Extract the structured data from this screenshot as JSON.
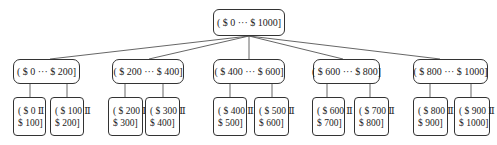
{
  "tree": {
    "root": {
      "label": "( $ 0 ··· $ 1000]"
    },
    "children": [
      {
        "label": "( $ 0 ··· $ 200]",
        "children": [
          {
            "line1": "( $ 0 Ⅱ",
            "line2": "$ 100]"
          },
          {
            "line1": "( $ 100 Ⅱ",
            "line2": "$ 200]"
          }
        ]
      },
      {
        "label": "( $ 200 ··· $ 400]",
        "children": [
          {
            "line1": "( $ 200 Ⅱ",
            "line2": "$ 300]"
          },
          {
            "line1": "( $ 300 Ⅱ",
            "line2": "$ 400]"
          }
        ]
      },
      {
        "label": "( $ 400 ··· $ 600]",
        "children": [
          {
            "line1": "( $ 400 Ⅱ",
            "line2": "$ 500]"
          },
          {
            "line1": "( $ 500 Ⅱ",
            "line2": "$ 600]"
          }
        ]
      },
      {
        "label": "( $ 600 ··· $ 800]",
        "children": [
          {
            "line1": "( $ 600 Ⅱ",
            "line2": "$ 700]"
          },
          {
            "line1": "( $ 700 Ⅱ",
            "line2": "$ 800]"
          }
        ]
      },
      {
        "label": "( $ 800 ··· $ 1000]",
        "children": [
          {
            "line1": "( $ 800 Ⅱ",
            "line2": "$ 900]"
          },
          {
            "line1": "( $ 900 Ⅱ",
            "line2": "$ 1000]"
          }
        ]
      }
    ]
  },
  "colors": {
    "stroke": "#333333",
    "line": "#555555",
    "background": "#ffffff"
  }
}
